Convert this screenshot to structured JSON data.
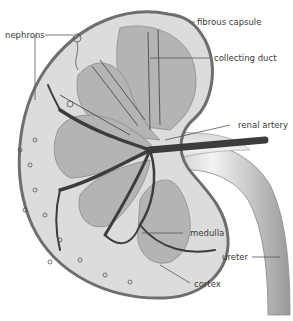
{
  "diagram": {
    "labels": {
      "nephrons": "nephrons",
      "fibrous_capsule": "fibrous capsule",
      "collecting_duct": "collecting duct",
      "renal_artery": "renal artery",
      "medulla": "medulla",
      "ureter": "ureter",
      "cortex": "cortex"
    },
    "colors": {
      "capsule": "#6e6e6e",
      "cortex": "#dcdcdc",
      "medulla": "#b4b4b4",
      "artery": "#3c3c3c",
      "ureter_light": "#efefef",
      "ureter_dark": "#a8a8a8",
      "background": "#ffffff"
    }
  }
}
